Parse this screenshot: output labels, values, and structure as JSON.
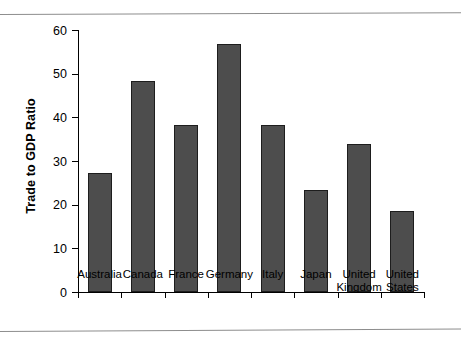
{
  "chart_data": {
    "type": "bar",
    "title": "",
    "xlabel": "",
    "ylabel": "Trade to GDP Ratio",
    "categories": [
      "Australia",
      "Canada",
      "France",
      "Germany",
      "Italy",
      "Japan",
      "United Kingdom",
      "United States"
    ],
    "category_lines": [
      [
        "Australia"
      ],
      [
        "Canada"
      ],
      [
        "France"
      ],
      [
        "Germany"
      ],
      [
        "Italy"
      ],
      [
        "Japan"
      ],
      [
        "United",
        "Kingdom"
      ],
      [
        "United",
        "States"
      ]
    ],
    "values": [
      27.2,
      48.3,
      38.3,
      56.8,
      38.3,
      23.3,
      33.8,
      18.5
    ],
    "ylim": [
      0,
      60
    ],
    "ytick_values": [
      0,
      10,
      20,
      30,
      40,
      50,
      60
    ],
    "ytick_labels": [
      "0",
      "10",
      "20",
      "30",
      "40",
      "50",
      "60"
    ],
    "grid": false,
    "legend": false,
    "bar_color": "#4d4d4d",
    "bar_edge_color": "#1d1d1d",
    "axis_color": "#000000",
    "rule_color": "#8d8d8d",
    "background": "#ffffff"
  }
}
